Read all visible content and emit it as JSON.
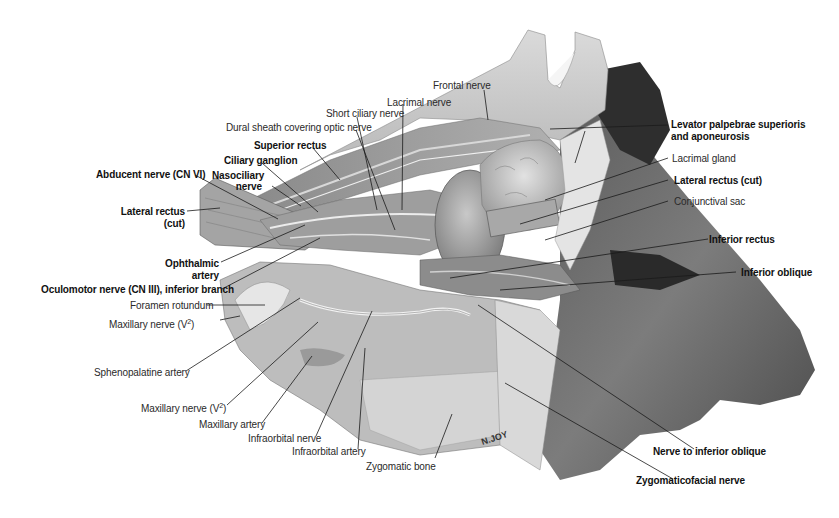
{
  "figure": {
    "signature": "N.JOY",
    "colors": {
      "background": "#ffffff",
      "bone": "#cfcfcf",
      "muscle": "#9a9a9a",
      "skin": "#7a7a7a",
      "dark": "#3a3a3a",
      "leader_line": "#1a1a1a"
    }
  },
  "labels": {
    "frontal_nerve": "Frontal nerve",
    "lacrimal_nerve": "Lacrimal nerve",
    "short_ciliary_nerve": "Short ciliary nerve",
    "dural_sheath": "Dural sheath covering optic nerve",
    "superior_rectus": "Superior rectus",
    "ciliary_ganglion": "Ciliary ganglion",
    "abducent_nerve": "Abducent nerve (CN VI)",
    "nasociliary_nerve_1": "Nasociliary",
    "nasociliary_nerve_2": "nerve",
    "lateral_rectus_left_1": "Lateral rectus",
    "lateral_rectus_left_2": "(cut)",
    "ophthalmic_artery_1": "Ophthalmic",
    "ophthalmic_artery_2": "artery",
    "oculomotor_nerve": "Oculomotor nerve (CN III), inferior branch",
    "foramen_rotundum": "Foramen rotundum",
    "maxillary_nerve_top": "Maxillary nerve (V",
    "maxillary_nerve_sup": "2",
    "maxillary_nerve_close": ")",
    "sphenopalatine_artery": "Sphenopalatine artery",
    "maxillary_nerve_bottom": "Maxillary nerve (V",
    "maxillary_artery": "Maxillary artery",
    "infraorbital_nerve": "Infraorbital nerve",
    "infraorbital_artery": "Infraorbital artery",
    "zygomatic_bone": "Zygomatic bone",
    "levator_1": "Levator palpebrae superioris",
    "levator_2": "and aponeurosis",
    "lacrimal_gland": "Lacrimal gland",
    "lateral_rectus_right": "Lateral rectus (cut)",
    "conjunctival_sac": "Conjunctival sac",
    "inferior_rectus": "Inferior rectus",
    "inferior_oblique": "Inferior oblique",
    "nerve_to_inferior_oblique": "Nerve to inferior oblique",
    "zygomaticofacial_nerve": "Zygomaticofacial nerve"
  }
}
